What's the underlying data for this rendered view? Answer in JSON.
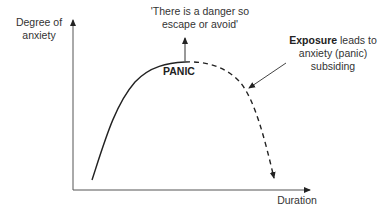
{
  "diagram": {
    "y_axis_label": "Degree of anxiety",
    "x_axis_label": "Duration",
    "quote": "'There is a danger so escape or avoid'",
    "peak_label": "PANIC",
    "exposure_label_bold": "Exposure",
    "exposure_label_rest": "leads to anxiety (panic) subsiding",
    "curve_colors": {
      "line": "#222222",
      "axis": "#555555"
    }
  }
}
